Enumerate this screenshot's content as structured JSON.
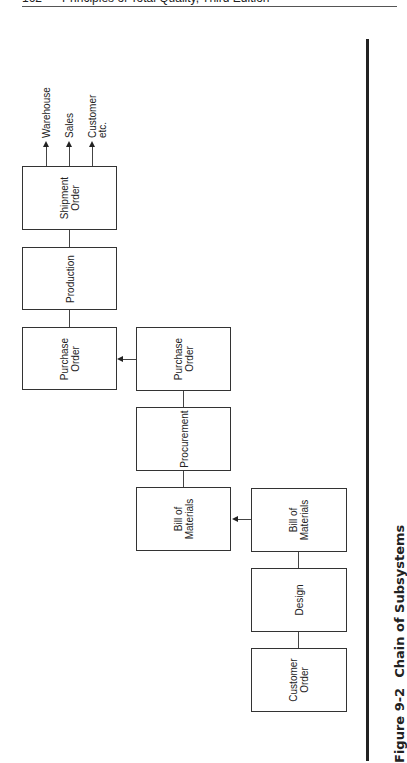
{
  "header": {
    "page_number": "162",
    "book_title": "Principles of Total Quality, Third Edition"
  },
  "figure": {
    "number": "Figure 9-2",
    "title": "Chain of Subsystems"
  },
  "boxes": {
    "shipment_order": "Shipment\nOrder",
    "production": "Production",
    "purchase_order_left": "Purchase\nOrder",
    "purchase_order_mid": "Purchase\nOrder",
    "procurement": "Procurement",
    "bill_of_materials_mid": "Bill of\nMaterials",
    "bill_of_materials_right": "Bill of\nMaterials",
    "design": "Design",
    "customer_order": "Customer\nOrder"
  },
  "outputs": {
    "warehouse": "Warehouse",
    "sales": "Sales",
    "customer": "Customer",
    "etc": "etc."
  },
  "colors": {
    "line": "#333333",
    "text": "#222222",
    "background": "#ffffff"
  }
}
